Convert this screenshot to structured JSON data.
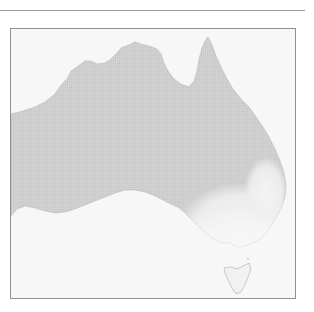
{
  "map": {
    "subject": "Australia",
    "style": "grayscale halftone",
    "colors": {
      "land": "#cfcfcf",
      "highlight_region": "#ebebeb",
      "water": "#f7f7f7",
      "frame_border": "#8f8f8f",
      "rule": "#9a9a9a"
    },
    "regions": [
      {
        "name": "Mainland Australia"
      },
      {
        "name": "Southeast highlighted region"
      },
      {
        "name": "Tasmania"
      }
    ]
  }
}
